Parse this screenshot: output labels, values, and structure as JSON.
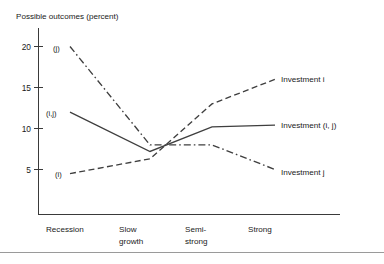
{
  "figure": {
    "title": "Possible outcomes (percent)",
    "axis_color": "#3a3a3a",
    "series_color": "#3f3f3f"
  },
  "axes": {
    "y_ticks": [
      "20",
      "15",
      "10",
      "5"
    ],
    "x_categories": [
      {
        "line1": "Recession",
        "line2": ""
      },
      {
        "line1": "Slow",
        "line2": "growth"
      },
      {
        "line1": "Semi-",
        "line2": "strong"
      },
      {
        "line1": "Strong",
        "line2": ""
      }
    ]
  },
  "legend": {
    "right_labels": [
      "Investment i",
      "Investment (i, j)",
      "Investment j"
    ],
    "inline_labels": [
      "(j)",
      "(i,j)",
      "(i)"
    ]
  },
  "chart_data": {
    "type": "line",
    "title": "Possible outcomes (percent)",
    "xlabel": "",
    "ylabel": "Possible outcomes (percent)",
    "categories": [
      "Recession",
      "Slow growth",
      "Semi-strong",
      "Strong"
    ],
    "ylim": [
      0,
      21
    ],
    "yticks": [
      5,
      10,
      15,
      20
    ],
    "grid": false,
    "legend_position": "right-of-plot (inline end labels)",
    "series": [
      {
        "name": "Investment i",
        "inline_label": "(i)",
        "style": "dashed",
        "values": [
          4.5,
          6.3,
          13.0,
          16.0
        ]
      },
      {
        "name": "Investment (i, j)",
        "inline_label": "(i,j)",
        "style": "solid",
        "values": [
          12.0,
          7.2,
          10.2,
          10.4
        ]
      },
      {
        "name": "Investment j",
        "inline_label": "(j)",
        "style": "dash-dot",
        "values": [
          20.0,
          8.0,
          8.0,
          5.0
        ]
      }
    ],
    "annotations": [
      "All three lines converge near a value of about 7.7 just right of the Slow growth category"
    ]
  }
}
